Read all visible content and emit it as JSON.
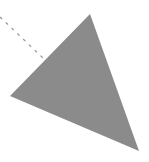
{
  "canvas": {
    "width": 149,
    "height": 162,
    "background_color": "#ffffff",
    "title": "Gray triangle with dashed leader line"
  },
  "figure": {
    "shapes": [
      {
        "name": "triangle",
        "type": "polygon",
        "fill_color": "#8b8b8b",
        "stroke_color": "none",
        "stroke_width": 0,
        "opacity": 1,
        "points": "90,14 139,151 10,96",
        "vertices": [
          {
            "label": "apex",
            "x": 90,
            "y": 14
          },
          {
            "label": "bottom-right",
            "x": 139,
            "y": 151
          },
          {
            "label": "left",
            "x": 10,
            "y": 96
          }
        ]
      },
      {
        "name": "dashed-line",
        "type": "line",
        "stroke_color": "#9a9a9a",
        "stroke_width": 1.3,
        "dash_pattern": "3 5",
        "x1": 0,
        "y1": 17,
        "x2": 43,
        "y2": 58
      }
    ]
  },
  "colors": {
    "triangle_gray": "#8b8b8b",
    "dash_gray": "#9a9a9a",
    "background_white": "#ffffff"
  }
}
